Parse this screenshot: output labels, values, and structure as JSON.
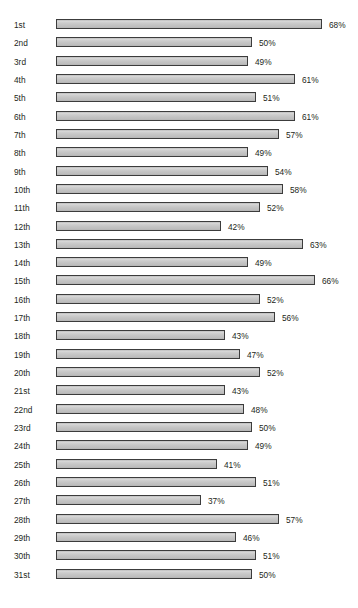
{
  "chart_data": {
    "type": "bar",
    "orientation": "horizontal",
    "title": "",
    "xlabel": "",
    "ylabel": "",
    "xlim": [
      0,
      74
    ],
    "grid": false,
    "legend": null,
    "value_suffix": "%",
    "categories": [
      "1st",
      "2nd",
      "3rd",
      "4th",
      "5th",
      "6th",
      "7th",
      "8th",
      "9th",
      "10th",
      "11th",
      "12th",
      "13th",
      "14th",
      "15th",
      "16th",
      "17th",
      "18th",
      "19th",
      "20th",
      "21st",
      "22nd",
      "23rd",
      "24th",
      "25th",
      "26th",
      "27th",
      "28th",
      "29th",
      "30th",
      "31st"
    ],
    "values": [
      68,
      50,
      49,
      61,
      51,
      61,
      57,
      49,
      54,
      58,
      52,
      42,
      63,
      49,
      66,
      52,
      56,
      43,
      47,
      52,
      43,
      48,
      50,
      49,
      41,
      51,
      37,
      57,
      46,
      51,
      50
    ],
    "value_labels": [
      "68%",
      "50%",
      "49%",
      "61%",
      "51%",
      "61%",
      "57%",
      "49%",
      "54%",
      "58%",
      "52%",
      "42%",
      "63%",
      "49%",
      "66%",
      "52%",
      "56%",
      "43%",
      "47%",
      "52%",
      "43%",
      "48%",
      "50%",
      "49%",
      "41%",
      "51%",
      "37%",
      "57%",
      "46%",
      "51%",
      "50%"
    ]
  },
  "style": {
    "bar_fill": "#c6c6c6",
    "bar_border": "#3c3c3c",
    "text_color": "#231f20",
    "background": "#ffffff"
  }
}
